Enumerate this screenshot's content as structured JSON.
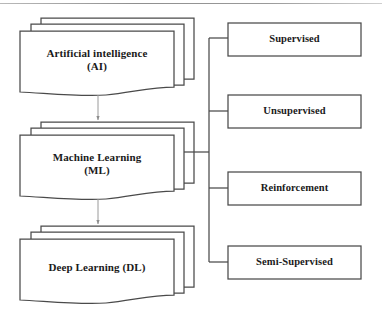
{
  "diagram": {
    "type": "block-diagram",
    "background_color": "#ffffff",
    "line_color": "#4a4a4a",
    "text_color": "#1a1a1a",
    "top_rule": true,
    "left_column": {
      "shape": "stacked-document",
      "stack_layers": 3,
      "nodes": [
        {
          "id": "ai",
          "label": "Artificial intelligence\n(AI)",
          "lines": [
            "Artificial intelligence",
            "(AI)"
          ]
        },
        {
          "id": "ml",
          "label": "Machine Learning\n(ML)",
          "lines": [
            "Machine Learning",
            "(ML)"
          ]
        },
        {
          "id": "dl",
          "label": "Deep Learning (DL)",
          "lines": [
            "Deep Learning (DL)"
          ]
        }
      ]
    },
    "right_column": {
      "shape": "rectangle",
      "nodes": [
        {
          "id": "supervised",
          "label": "Supervised"
        },
        {
          "id": "unsupervised",
          "label": "Unsupervised"
        },
        {
          "id": "reinforcement",
          "label": "Reinforcement"
        },
        {
          "id": "semi_supervised",
          "label": "Semi-Supervised"
        }
      ]
    },
    "connectors": [
      {
        "id": "ai-to-ml",
        "from": "ai",
        "to": "ml",
        "style": "arrow",
        "direction": "down"
      },
      {
        "id": "ml-to-dl",
        "from": "ml",
        "to": "dl",
        "style": "arrow",
        "direction": "down"
      },
      {
        "id": "ml-to-spine",
        "from": "ml",
        "to": "spine",
        "style": "line"
      },
      {
        "id": "spine-to-supervised",
        "from": "spine",
        "to": "supervised",
        "style": "line"
      },
      {
        "id": "spine-to-unsupervised",
        "from": "spine",
        "to": "unsupervised",
        "style": "line"
      },
      {
        "id": "spine-to-reinforcement",
        "from": "spine",
        "to": "reinforcement",
        "style": "line"
      },
      {
        "id": "spine-to-semi-supervised",
        "from": "spine",
        "to": "semi_supervised",
        "style": "line"
      }
    ]
  }
}
